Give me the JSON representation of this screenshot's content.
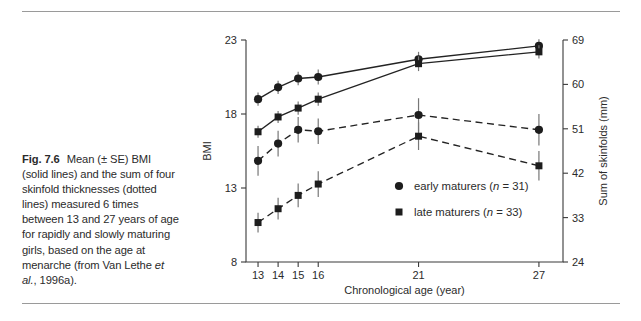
{
  "figure": {
    "number": "Fig. 7.6",
    "caption_lines": [
      "Mean (± SE) BMI",
      "(solid lines) and the sum of four",
      "skinfold thicknesses (dotted",
      "lines) measured 6 times",
      "between 13 and 27 years of age",
      "for rapidly and slowly maturing",
      "girls, based on the age at",
      "menarche (from Van Lethe et",
      "al., 1996a)."
    ],
    "caption_full": "Fig. 7.6 Mean (± SE) BMI (solid lines) and the sum of four skinfold thicknesses (dotted lines) measured 6 times between 13 and 27 years of age for rapidly and slowly maturing girls, based on the age at menarche (from Van Lethe et al., 1996a)."
  },
  "chart_data": {
    "type": "line",
    "title": "",
    "xlabel": "Chronological age (year)",
    "ylabel": "BMI",
    "y2label": "Sum of skinfolds (mm)",
    "x": [
      13,
      14,
      15,
      16,
      21,
      27
    ],
    "xtick_labels": [
      "13",
      "14",
      "15",
      "16",
      "21",
      "27"
    ],
    "xlim": [
      12.4,
      28.2
    ],
    "ylim": [
      8,
      23
    ],
    "ytick_labels": [
      "8",
      "13",
      "18",
      "23"
    ],
    "yticks": [
      8,
      13,
      18,
      23
    ],
    "y2lim": [
      24,
      69
    ],
    "y2tick_labels": [
      "24",
      "33",
      "42",
      "51",
      "60",
      "69"
    ],
    "y2ticks": [
      24,
      33,
      42,
      51,
      60,
      69
    ],
    "grid": false,
    "legend_position": "center-right",
    "series": [
      {
        "name": "early maturers BMI",
        "legend": "early maturers",
        "n": 31,
        "marker": "circle",
        "linestyle": "solid",
        "axis": "left",
        "values": [
          19.0,
          19.8,
          20.4,
          20.5,
          21.7,
          22.6
        ],
        "errors": [
          0.45,
          0.45,
          0.45,
          0.5,
          0.5,
          0.45
        ]
      },
      {
        "name": "late maturers BMI",
        "legend": "late maturers",
        "n": 33,
        "marker": "square",
        "linestyle": "solid",
        "axis": "left",
        "values": [
          16.8,
          17.8,
          18.4,
          19.0,
          21.4,
          22.2
        ],
        "errors": [
          0.4,
          0.4,
          0.45,
          0.45,
          0.5,
          0.45
        ]
      },
      {
        "name": "early maturers skinfolds",
        "legend": "early maturers",
        "n": 31,
        "marker": "circle",
        "linestyle": "dashed",
        "axis": "right",
        "values": [
          44.5,
          48.0,
          50.8,
          50.5,
          53.8,
          50.8
        ],
        "errors": [
          3.0,
          2.6,
          2.6,
          2.6,
          3.4,
          3.2
        ]
      },
      {
        "name": "late maturers skinfolds",
        "legend": "late maturers",
        "n": 33,
        "marker": "square",
        "linestyle": "dashed",
        "axis": "right",
        "values": [
          32.0,
          34.8,
          37.5,
          39.8,
          49.5,
          43.5
        ],
        "errors": [
          2.0,
          2.2,
          2.4,
          2.6,
          2.8,
          3.0
        ]
      }
    ],
    "legend": [
      {
        "marker": "circle",
        "label": "early maturers",
        "n_prefix": "(",
        "n_var": "n",
        "n_eq": " = ",
        "n_value": "31",
        "n_suffix": ")"
      },
      {
        "marker": "square",
        "label": "late maturers",
        "n_prefix": "(",
        "n_var": "n",
        "n_eq": " = ",
        "n_value": "33",
        "n_suffix": ")"
      }
    ],
    "colors": {
      "marker": "#1d1d1d",
      "line": "#232323",
      "error_bar": "#777777",
      "axis": "#3a3a3a",
      "text": "#2b2b2b",
      "background": "#ffffff"
    }
  }
}
